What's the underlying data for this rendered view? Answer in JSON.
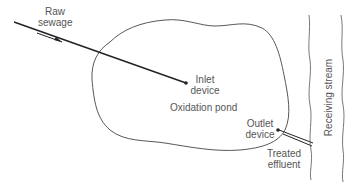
{
  "diagram": {
    "colors": {
      "line": "#222222",
      "outline": "#444444",
      "text": "#555555",
      "background": "#ffffff"
    },
    "labels": {
      "raw_sewage_line1": "Raw",
      "raw_sewage_line2": "sewage",
      "inlet_line1": "Inlet",
      "inlet_line2": "device",
      "pond": "Oxidation pond",
      "outlet_line1": "Outlet",
      "outlet_line2": "device",
      "effluent_line1": "Treated",
      "effluent_line2": "effluent",
      "stream": "Receiving stream"
    },
    "elements": [
      {
        "id": "inlet-pipe",
        "type": "line"
      },
      {
        "id": "flow-arrow",
        "type": "arrow"
      },
      {
        "id": "pond-outline",
        "type": "closed-curve"
      },
      {
        "id": "inlet-device",
        "type": "dot"
      },
      {
        "id": "outlet-device",
        "type": "dot"
      },
      {
        "id": "outlet-pipe",
        "type": "double-line"
      },
      {
        "id": "stream-bank-left",
        "type": "wavy-line"
      },
      {
        "id": "stream-bank-right",
        "type": "wavy-line"
      }
    ]
  }
}
